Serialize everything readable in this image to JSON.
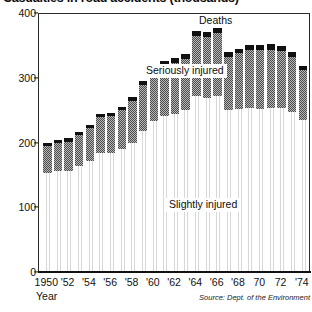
{
  "chart_data": {
    "type": "bar",
    "subtype": "stacked-bar",
    "title": "Casualties in road accidents (thousands)",
    "xlabel": "Year",
    "ylabel": "",
    "source": "Source: Dept. of the Environment",
    "ylim": [
      0,
      400
    ],
    "yticks": [
      0,
      100,
      200,
      300,
      400
    ],
    "ytick_labels": [
      "0",
      "100",
      "200",
      "300",
      "400"
    ],
    "grid": false,
    "legend_position": "in-plot annotations",
    "x": [
      1950,
      1951,
      1952,
      1953,
      1954,
      1955,
      1956,
      1957,
      1958,
      1959,
      1960,
      1961,
      1962,
      1963,
      1964,
      1965,
      1966,
      1967,
      1968,
      1969,
      1970,
      1971,
      1972,
      1973,
      1974
    ],
    "xtick_labels": [
      "1950",
      "'52",
      "'54",
      "'56",
      "'58",
      "'60",
      "'62",
      "'64",
      "'66",
      "'68",
      "70",
      "72",
      "'74"
    ],
    "xtick_years": [
      1950,
      1952,
      1954,
      1956,
      1958,
      1960,
      1962,
      1964,
      1966,
      1968,
      1970,
      1972,
      1974
    ],
    "series": [
      {
        "name": "Slightly injured",
        "fill": "light-vertical-dither",
        "values": [
          151,
          154,
          155,
          162,
          170,
          183,
          182,
          188,
          198,
          217,
          232,
          240,
          243,
          249,
          271,
          267,
          271,
          248,
          250,
          251,
          250,
          252,
          251,
          245,
          234
        ]
      },
      {
        "name": "Seriously injured",
        "fill": "mid-grey-checker",
        "values": [
          42,
          44,
          45,
          48,
          51,
          55,
          57,
          60,
          65,
          70,
          74,
          78,
          79,
          79,
          92,
          94,
          97,
          83,
          86,
          91,
          92,
          90,
          89,
          86,
          76
        ]
      },
      {
        "name": "Deaths",
        "fill": "solid-black",
        "values": [
          5,
          5,
          5,
          5,
          5,
          5,
          5,
          6,
          6,
          6,
          7,
          7,
          7,
          7,
          8,
          8,
          8,
          7,
          7,
          7,
          7,
          8,
          8,
          7,
          7
        ]
      }
    ],
    "totals": [
      198,
      203,
      205,
      215,
      226,
      243,
      244,
      254,
      269,
      293,
      313,
      325,
      329,
      335,
      371,
      369,
      376,
      338,
      343,
      349,
      349,
      350,
      348,
      338,
      317
    ],
    "annotations": [
      {
        "text": "Deaths",
        "series": "Deaths"
      },
      {
        "text": "Seriously injured",
        "series": "Seriously injured"
      },
      {
        "text": "Slightly injured",
        "series": "Slightly injured"
      }
    ]
  }
}
